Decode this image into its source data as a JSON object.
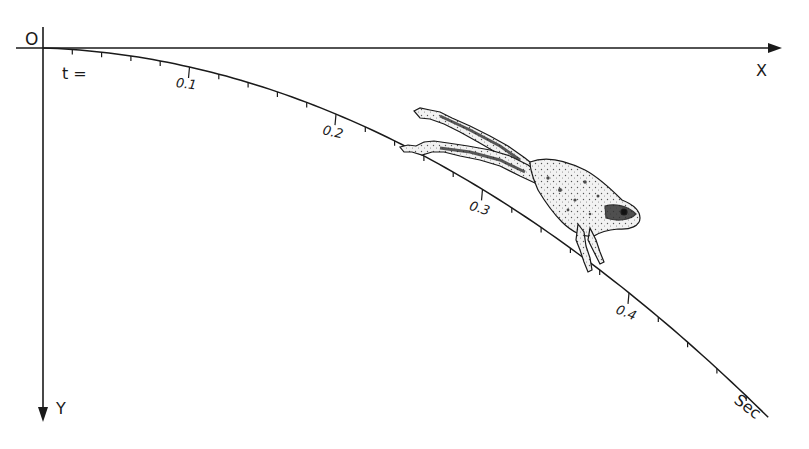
{
  "diagram": {
    "type": "trajectory-diagram",
    "origin_label": "O",
    "x_axis_label": "X",
    "y_axis_label": "Y",
    "time_prefix": "t =",
    "time_unit_label": "Sec",
    "major_ticks": [
      {
        "t": 0.1,
        "label": "0.1"
      },
      {
        "t": 0.2,
        "label": "0.2"
      },
      {
        "t": 0.3,
        "label": "0.3"
      },
      {
        "t": 0.4,
        "label": "0.4"
      }
    ],
    "minor_tick_interval": 0.02,
    "t_max": 0.495,
    "colors": {
      "ink": "#1a1a1a",
      "background": "#ffffff",
      "frog_shade": "#6b6b6b",
      "frog_light": "#e8e8e8"
    }
  }
}
